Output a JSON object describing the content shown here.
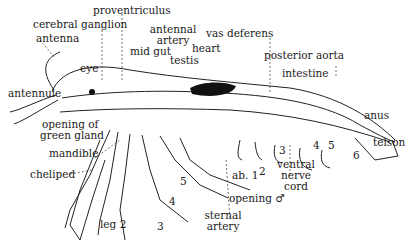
{
  "figure": {
    "labels": {
      "proventriculus": "proventriculus",
      "cerebral_ganglion": "cerebral ganglion",
      "antenna": "antenna",
      "eye": "eye",
      "antennule": "antennule",
      "antennal_artery_1": "antennal",
      "antennal_artery_2": "artery",
      "mid_gut": "mid gut",
      "testis": "testis",
      "heart": "heart",
      "vas_deferens": "vas deferens",
      "posterior_aorta": "posterior aorta",
      "intestine": "intestine",
      "anus": "anus",
      "telson": "telson",
      "opening_green_gland_1": "opening of",
      "opening_green_gland_2": "green gland",
      "mandible": "mandible",
      "cheliped": "cheliped",
      "leg2": "leg 2",
      "leg3": "3",
      "leg4": "4",
      "leg5": "5",
      "ab1": "ab. 1",
      "ab2": "2",
      "ab3": "3",
      "ab4": "4",
      "ab5": "5",
      "ab6": "6",
      "opening_male": "opening ♂",
      "sternal_artery_1": "sternal",
      "sternal_artery_2": "artery",
      "ventral_nerve_cord_1": "ventral",
      "ventral_nerve_cord_2": "nerve",
      "ventral_nerve_cord_3": "cord"
    }
  }
}
